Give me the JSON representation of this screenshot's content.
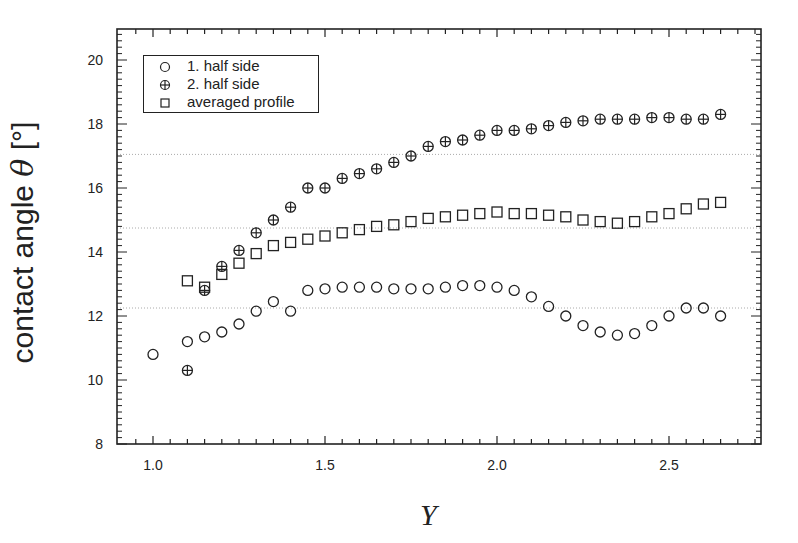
{
  "chart_data": {
    "type": "scatter",
    "title": "",
    "xlabel": "Y",
    "ylabel": "contact angle θ  [°]",
    "ylabel_text": "contact angle ",
    "ylabel_symbol": "θ",
    "ylabel_unit": "  [°]",
    "xlim": [
      0.9,
      2.78
    ],
    "ylim": [
      8,
      21
    ],
    "xticks": [
      1.0,
      1.5,
      2.0,
      2.5
    ],
    "xtick_labels": [
      "1.0",
      "1.5",
      "2.0",
      "2.5"
    ],
    "yticks": [
      8,
      10,
      12,
      14,
      16,
      18,
      20
    ],
    "ytick_labels": [
      "8",
      "10",
      "12",
      "14",
      "16",
      "18",
      "20"
    ],
    "grid": false,
    "reference_lines_y": [
      17.05,
      14.75,
      12.25
    ],
    "legend_position": "upper left",
    "series": [
      {
        "name": "1. half side",
        "marker": "open-circle",
        "x": [
          1.0,
          1.1,
          1.15,
          1.2,
          1.25,
          1.3,
          1.35,
          1.4,
          1.45,
          1.5,
          1.55,
          1.6,
          1.65,
          1.7,
          1.75,
          1.8,
          1.85,
          1.9,
          1.95,
          2.0,
          2.05,
          2.1,
          2.15,
          2.2,
          2.25,
          2.3,
          2.35,
          2.4,
          2.45,
          2.5,
          2.55,
          2.6,
          2.65
        ],
        "values": [
          10.8,
          11.2,
          11.35,
          11.5,
          11.75,
          12.15,
          12.45,
          12.15,
          12.8,
          12.85,
          12.9,
          12.9,
          12.9,
          12.85,
          12.85,
          12.85,
          12.9,
          12.95,
          12.95,
          12.9,
          12.8,
          12.6,
          12.3,
          12.0,
          11.7,
          11.5,
          11.4,
          11.45,
          11.7,
          12.0,
          12.25,
          12.25,
          12.0
        ]
      },
      {
        "name": "2. half side",
        "marker": "crossed-circle",
        "x": [
          1.1,
          1.15,
          1.2,
          1.25,
          1.3,
          1.35,
          1.4,
          1.45,
          1.5,
          1.55,
          1.6,
          1.65,
          1.7,
          1.75,
          1.8,
          1.85,
          1.9,
          1.95,
          2.0,
          2.05,
          2.1,
          2.15,
          2.2,
          2.25,
          2.3,
          2.35,
          2.4,
          2.45,
          2.5,
          2.55,
          2.6,
          2.65
        ],
        "values": [
          10.3,
          12.8,
          13.55,
          14.05,
          14.6,
          15.0,
          15.4,
          16.0,
          16.0,
          16.3,
          16.45,
          16.6,
          16.8,
          17.0,
          17.3,
          17.45,
          17.5,
          17.65,
          17.8,
          17.8,
          17.85,
          17.95,
          18.05,
          18.1,
          18.15,
          18.15,
          18.15,
          18.2,
          18.2,
          18.15,
          18.15,
          18.3
        ]
      },
      {
        "name": "averaged profile",
        "marker": "open-square",
        "x": [
          1.1,
          1.15,
          1.2,
          1.25,
          1.3,
          1.35,
          1.4,
          1.45,
          1.5,
          1.55,
          1.6,
          1.65,
          1.7,
          1.75,
          1.8,
          1.85,
          1.9,
          1.95,
          2.0,
          2.05,
          2.1,
          2.15,
          2.2,
          2.25,
          2.3,
          2.35,
          2.4,
          2.45,
          2.5,
          2.55,
          2.6,
          2.65
        ],
        "values": [
          13.1,
          12.9,
          13.3,
          13.65,
          13.95,
          14.2,
          14.3,
          14.4,
          14.5,
          14.6,
          14.7,
          14.8,
          14.85,
          14.95,
          15.05,
          15.1,
          15.15,
          15.2,
          15.25,
          15.2,
          15.2,
          15.15,
          15.1,
          15.0,
          14.95,
          14.9,
          14.95,
          15.1,
          15.2,
          15.35,
          15.5,
          15.55
        ]
      }
    ]
  },
  "legend": {
    "items": [
      {
        "label": "1. half side",
        "marker": "open-circle"
      },
      {
        "label": "2. half side",
        "marker": "crossed-circle"
      },
      {
        "label": "averaged profile",
        "marker": "open-square"
      }
    ]
  },
  "colors": {
    "ink": "#222222",
    "reference_line": "#aaaaaa",
    "background": "#ffffff"
  }
}
